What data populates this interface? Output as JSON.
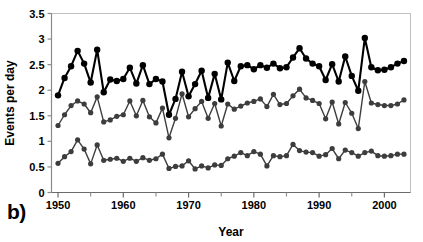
{
  "figure": {
    "panel_label": "b)"
  },
  "chart_data": {
    "type": "line",
    "title": "",
    "xlabel": "Year",
    "ylabel": "Events per day",
    "xlim": [
      1949,
      2004
    ],
    "ylim": [
      0,
      3.5
    ],
    "yticks": [
      0,
      0.5,
      1,
      1.5,
      2,
      2.5,
      3,
      3.5
    ],
    "ytick_labels": [
      "0",
      "0.5",
      "1",
      "1.5",
      "2",
      "2.5",
      "3",
      "3.5"
    ],
    "xticks": [
      1950,
      1960,
      1970,
      1980,
      1990,
      2000
    ],
    "xtick_labels": [
      "1950",
      "1960",
      "1970",
      "1980",
      "1990",
      "2000"
    ],
    "xminor_ticks": [
      1955,
      1965,
      1975,
      1985,
      1995
    ],
    "grid": false,
    "legend": "none",
    "markers": true,
    "x": [
      1950,
      1951,
      1952,
      1953,
      1954,
      1955,
      1956,
      1957,
      1958,
      1959,
      1960,
      1961,
      1962,
      1963,
      1964,
      1965,
      1966,
      1967,
      1968,
      1969,
      1970,
      1971,
      1972,
      1973,
      1974,
      1975,
      1976,
      1977,
      1978,
      1979,
      1980,
      1981,
      1982,
      1983,
      1984,
      1985,
      1986,
      1987,
      1988,
      1989,
      1990,
      1991,
      1992,
      1993,
      1994,
      1995,
      1996,
      1997,
      1998,
      1999,
      2000,
      2001,
      2002,
      2003
    ],
    "series": [
      {
        "name": "upper",
        "color": "#000000",
        "line_width": 2.1,
        "marker_size": 3.2,
        "values": [
          1.9,
          2.24,
          2.47,
          2.77,
          2.52,
          2.15,
          2.79,
          1.96,
          2.21,
          2.18,
          2.22,
          2.44,
          2.13,
          2.49,
          2.12,
          2.22,
          2.17,
          1.52,
          1.83,
          2.36,
          1.88,
          2.12,
          2.38,
          1.85,
          2.32,
          1.82,
          2.54,
          2.18,
          2.47,
          2.49,
          2.41,
          2.49,
          2.44,
          2.52,
          2.43,
          2.45,
          2.64,
          2.82,
          2.62,
          2.52,
          2.47,
          2.2,
          2.51,
          2.17,
          2.66,
          2.28,
          1.99,
          3.02,
          2.45,
          2.39,
          2.4,
          2.45,
          2.52,
          2.57
        ]
      },
      {
        "name": "middle",
        "color": "#3d3d3d",
        "line_width": 1.4,
        "marker_size": 2.6,
        "values": [
          1.31,
          1.52,
          1.7,
          1.79,
          1.73,
          1.56,
          1.87,
          1.38,
          1.42,
          1.49,
          1.52,
          1.79,
          1.5,
          1.8,
          1.48,
          1.36,
          1.65,
          1.07,
          1.45,
          1.93,
          1.48,
          1.64,
          1.78,
          1.45,
          1.74,
          1.3,
          1.73,
          1.63,
          1.69,
          1.75,
          1.78,
          1.83,
          1.68,
          1.92,
          1.72,
          1.74,
          1.89,
          2.02,
          1.85,
          1.8,
          1.74,
          1.44,
          1.77,
          1.34,
          1.76,
          1.55,
          1.25,
          2.17,
          1.75,
          1.72,
          1.7,
          1.7,
          1.73,
          1.81
        ]
      },
      {
        "name": "lower",
        "color": "#3d3d3d",
        "line_width": 1.4,
        "marker_size": 2.6,
        "values": [
          0.57,
          0.7,
          0.8,
          1.03,
          0.85,
          0.56,
          0.93,
          0.63,
          0.65,
          0.67,
          0.61,
          0.67,
          0.61,
          0.68,
          0.63,
          0.66,
          0.75,
          0.47,
          0.51,
          0.52,
          0.62,
          0.46,
          0.52,
          0.48,
          0.54,
          0.53,
          0.66,
          0.71,
          0.78,
          0.72,
          0.8,
          0.75,
          0.52,
          0.72,
          0.7,
          0.72,
          0.94,
          0.82,
          0.79,
          0.78,
          0.71,
          0.74,
          0.86,
          0.66,
          0.83,
          0.78,
          0.71,
          0.78,
          0.81,
          0.72,
          0.71,
          0.72,
          0.75,
          0.75
        ]
      }
    ]
  }
}
